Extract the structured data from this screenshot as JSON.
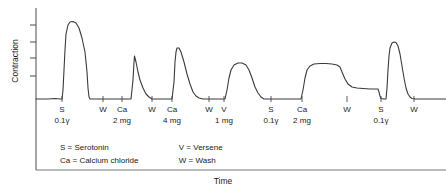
{
  "axes": {
    "ylabel": "Contraction",
    "xlabel": "Time",
    "y_tick_count": 6,
    "grid": false
  },
  "legend": {
    "left": [
      {
        "symbol": "S",
        "eq": "=",
        "term": "Serotonin"
      },
      {
        "symbol": "Ca",
        "eq": "=",
        "term": "Calcium chloride"
      }
    ],
    "right": [
      {
        "symbol": "V",
        "eq": "=",
        "term": "Versene"
      },
      {
        "symbol": "W",
        "eq": "=",
        "term": "Wash"
      }
    ]
  },
  "events": [
    {
      "symbol": "S",
      "dose": "0.1γ",
      "x": 62
    },
    {
      "symbol": "W",
      "dose": "",
      "x": 103
    },
    {
      "symbol": "Ca",
      "dose": "2 mg",
      "x": 122
    },
    {
      "symbol": "W",
      "dose": "",
      "x": 152
    },
    {
      "symbol": "Ca",
      "dose": "4 mg",
      "x": 172
    },
    {
      "symbol": "W",
      "dose": "",
      "x": 209
    },
    {
      "symbol": "V",
      "dose": "1 mg",
      "x": 224
    },
    {
      "symbol": "S",
      "dose": "0.1γ",
      "x": 271
    },
    {
      "symbol": "Ca",
      "dose": "2 mg",
      "x": 302
    },
    {
      "symbol": "W",
      "dose": "",
      "x": 347
    },
    {
      "symbol": "S",
      "dose": "0.1γ",
      "x": 381
    },
    {
      "symbol": "W",
      "dose": "",
      "x": 414
    }
  ],
  "chart_data": {
    "type": "line",
    "title": "",
    "xlabel": "Time",
    "ylabel": "Contraction",
    "grid": false,
    "legend_position": "inside-bottom-left",
    "axis_pixel_frame": {
      "x0": 36,
      "x1": 446,
      "y_top": 8,
      "y_baseline": 100
    },
    "y_ticks_px": [
      25,
      42,
      58,
      76
    ],
    "series": [
      {
        "name": "Contraction trace",
        "comment": "Kymograph tracing; points are (x_px, y_px) with y increasing downward, baseline at y=100.",
        "points": [
          [
            36,
            99
          ],
          [
            48,
            99
          ],
          [
            55,
            98.5
          ],
          [
            60,
            99
          ],
          [
            62,
            99
          ],
          [
            63,
            90
          ],
          [
            64,
            70
          ],
          [
            65,
            50
          ],
          [
            66,
            34
          ],
          [
            68,
            25
          ],
          [
            70,
            22
          ],
          [
            73,
            21.5
          ],
          [
            76,
            23
          ],
          [
            79,
            28
          ],
          [
            82,
            38
          ],
          [
            85,
            52
          ],
          [
            87,
            72
          ],
          [
            88,
            88
          ],
          [
            89,
            97
          ],
          [
            90,
            99
          ],
          [
            96,
            99
          ],
          [
            103,
            99
          ],
          [
            112,
            99
          ],
          [
            120,
            99
          ],
          [
            127,
            99
          ],
          [
            131,
            99
          ],
          [
            133,
            80
          ],
          [
            134,
            62
          ],
          [
            134.5,
            56
          ],
          [
            136,
            62
          ],
          [
            138,
            72
          ],
          [
            140,
            80
          ],
          [
            143,
            88
          ],
          [
            146,
            94
          ],
          [
            149,
            97
          ],
          [
            152,
            99
          ],
          [
            158,
            99
          ],
          [
            165,
            99
          ],
          [
            170,
            99
          ],
          [
            172,
            99
          ],
          [
            174,
            82
          ],
          [
            175,
            62
          ],
          [
            176,
            52
          ],
          [
            177,
            48
          ],
          [
            179,
            48
          ],
          [
            181,
            52
          ],
          [
            184,
            62
          ],
          [
            187,
            74
          ],
          [
            190,
            84
          ],
          [
            193,
            92
          ],
          [
            196,
            96
          ],
          [
            199,
            98
          ],
          [
            203,
            99
          ],
          [
            209,
            99
          ],
          [
            216,
            99
          ],
          [
            222,
            99
          ],
          [
            225,
            99
          ],
          [
            227,
            90
          ],
          [
            229,
            78
          ],
          [
            231,
            70
          ],
          [
            234,
            65
          ],
          [
            238,
            63
          ],
          [
            242,
            63
          ],
          [
            246,
            65
          ],
          [
            249,
            70
          ],
          [
            252,
            78
          ],
          [
            255,
            87
          ],
          [
            258,
            93
          ],
          [
            261,
            97
          ],
          [
            264,
            99
          ],
          [
            270,
            99
          ],
          [
            278,
            99
          ],
          [
            288,
            99
          ],
          [
            296,
            99
          ],
          [
            301,
            99
          ],
          [
            303,
            90
          ],
          [
            305,
            78
          ],
          [
            307,
            70
          ],
          [
            310,
            66
          ],
          [
            314,
            64
          ],
          [
            320,
            63.5
          ],
          [
            326,
            63.5
          ],
          [
            332,
            64
          ],
          [
            337,
            65
          ],
          [
            340,
            67
          ],
          [
            342,
            72
          ],
          [
            345,
            79
          ],
          [
            348,
            84
          ],
          [
            352,
            87
          ],
          [
            357,
            88
          ],
          [
            363,
            88.5
          ],
          [
            370,
            89
          ],
          [
            375,
            89
          ],
          [
            378,
            89
          ],
          [
            379,
            92
          ],
          [
            380,
            96
          ],
          [
            381,
            98.5
          ],
          [
            384,
            99
          ],
          [
            386,
            99
          ],
          [
            387,
            88
          ],
          [
            388,
            70
          ],
          [
            389,
            56
          ],
          [
            390,
            48
          ],
          [
            392,
            43
          ],
          [
            394,
            42
          ],
          [
            396,
            42.5
          ],
          [
            398,
            46
          ],
          [
            400,
            54
          ],
          [
            402,
            66
          ],
          [
            404,
            78
          ],
          [
            406,
            88
          ],
          [
            408,
            94
          ],
          [
            410,
            97
          ],
          [
            412,
            98.5
          ],
          [
            415,
            99
          ],
          [
            425,
            99
          ],
          [
            436,
            99
          ],
          [
            446,
            99
          ]
        ]
      }
    ]
  }
}
